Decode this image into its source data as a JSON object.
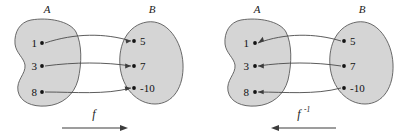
{
  "figure": {
    "caption_type": "function-and-inverse-mapping-diagram",
    "panels": [
      {
        "id": "forward",
        "domain_label": "A",
        "codomain_label": "B",
        "function_label": "f",
        "function_superscript": "",
        "direction": "right",
        "domain_elements": [
          "1",
          "3",
          "8"
        ],
        "codomain_elements": [
          "5",
          "7",
          "-10"
        ],
        "mappings": [
          {
            "from": "1",
            "to": "5"
          },
          {
            "from": "3",
            "to": "7"
          },
          {
            "from": "8",
            "to": "-10"
          }
        ]
      },
      {
        "id": "inverse",
        "domain_label": "A",
        "codomain_label": "B",
        "function_label": "f",
        "function_superscript": "-1",
        "direction": "left",
        "domain_elements": [
          "1",
          "3",
          "8"
        ],
        "codomain_elements": [
          "5",
          "7",
          "-10"
        ],
        "mappings": [
          {
            "from": "5",
            "to": "1"
          },
          {
            "from": "7",
            "to": "3"
          },
          {
            "from": "-10",
            "to": "8"
          }
        ]
      }
    ],
    "colors": {
      "blob_fill": "#d5d5d5",
      "blob_stroke": "#5a5a5a",
      "arrow_stroke": "#4a4a4a",
      "dot": "#141414",
      "background": "#ffffff"
    }
  }
}
